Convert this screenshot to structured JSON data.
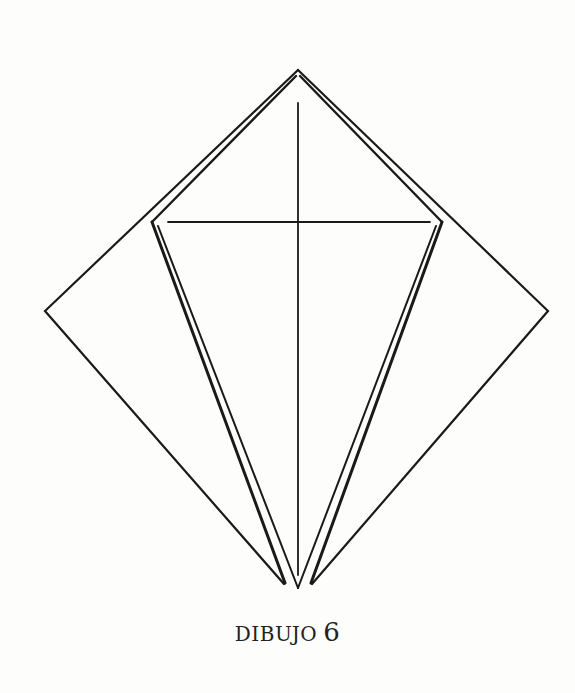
{
  "caption": {
    "word": "DIBUJO",
    "number": "6"
  },
  "diagram": {
    "stroke_color": "#1a1a1a",
    "background_color": "#fdfdfb",
    "outer_diamond": {
      "top": [
        298,
        70
      ],
      "left": [
        45,
        311
      ],
      "right": [
        548,
        311
      ],
      "bottom_left": [
        285,
        583
      ],
      "bottom_right": [
        311,
        583
      ]
    },
    "inner_kite": {
      "top": [
        298,
        74
      ],
      "left": [
        152,
        222
      ],
      "right": [
        442,
        222
      ],
      "bottom": [
        298,
        585
      ]
    },
    "horizontal_crease": {
      "y": 222,
      "x_start": 168,
      "x_end": 430
    },
    "vertical_crease": {
      "x": 298,
      "y_start": 103,
      "y_end": 575
    }
  }
}
